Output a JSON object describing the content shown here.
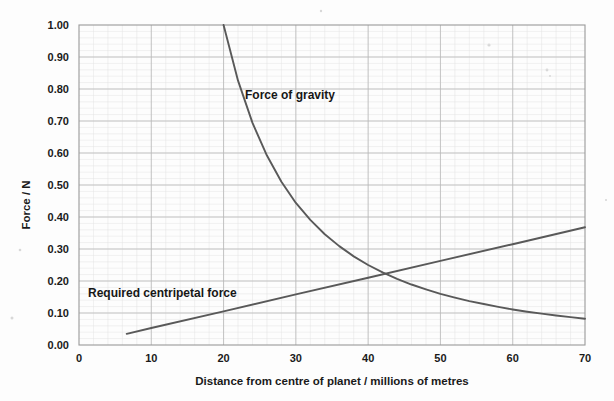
{
  "chart_data": {
    "type": "line",
    "title": "",
    "xlabel": "Distance from centre of planet / millions of metres",
    "ylabel": "Force / N",
    "xlim": [
      0,
      70
    ],
    "ylim": [
      0,
      1.0
    ],
    "xticks": [
      0,
      10,
      20,
      30,
      40,
      50,
      60,
      70
    ],
    "xtick_labels": [
      "0",
      "10",
      "20",
      "30",
      "40",
      "50",
      "60",
      "70"
    ],
    "yticks": [
      0.0,
      0.1,
      0.2,
      0.3,
      0.4,
      0.5,
      0.6,
      0.7,
      0.8,
      0.9,
      1.0
    ],
    "ytick_labels": [
      "0.00",
      "0.10",
      "0.20",
      "0.30",
      "0.40",
      "0.50",
      "0.60",
      "0.70",
      "0.80",
      "0.90",
      "1.00"
    ],
    "grid": true,
    "grid_minor": true,
    "legend": "none",
    "annotations": [
      {
        "text": "Force of gravity",
        "x": 23.0,
        "y": 0.775
      },
      {
        "text": "Required centripetal force",
        "x": 1.5,
        "y": 0.238
      }
    ],
    "series": [
      {
        "name": "Force of gravity",
        "kind": "inverse-square",
        "formula": "F = 400 / r^2",
        "x": [
          20,
          22,
          24,
          26,
          28,
          30,
          32,
          34,
          36,
          38,
          40,
          42,
          44,
          46,
          48,
          50,
          52,
          54,
          56,
          58,
          60,
          62,
          64,
          66,
          68,
          70
        ],
        "values": [
          1.0,
          0.826,
          0.694,
          0.592,
          0.51,
          0.444,
          0.391,
          0.346,
          0.309,
          0.277,
          0.25,
          0.227,
          0.207,
          0.189,
          0.174,
          0.16,
          0.148,
          0.137,
          0.128,
          0.119,
          0.111,
          0.104,
          0.098,
          0.092,
          0.087,
          0.082
        ]
      },
      {
        "name": "Required centripetal force",
        "kind": "linear",
        "formula": "F = 0.00526 * r",
        "x": [
          6.6,
          10,
          20,
          30,
          40,
          50,
          60,
          70
        ],
        "values": [
          0.035,
          0.053,
          0.105,
          0.158,
          0.21,
          0.263,
          0.315,
          0.368
        ]
      }
    ],
    "intersection": {
      "x": 42.1,
      "y": 0.228
    },
    "colors": {
      "series": "#595959",
      "grid_major": "#b9b9b9",
      "grid_minor": "#e3e3e3",
      "border": "#9a9a9a",
      "text": "#1a1a1a",
      "background": "#fdfdfd"
    }
  }
}
